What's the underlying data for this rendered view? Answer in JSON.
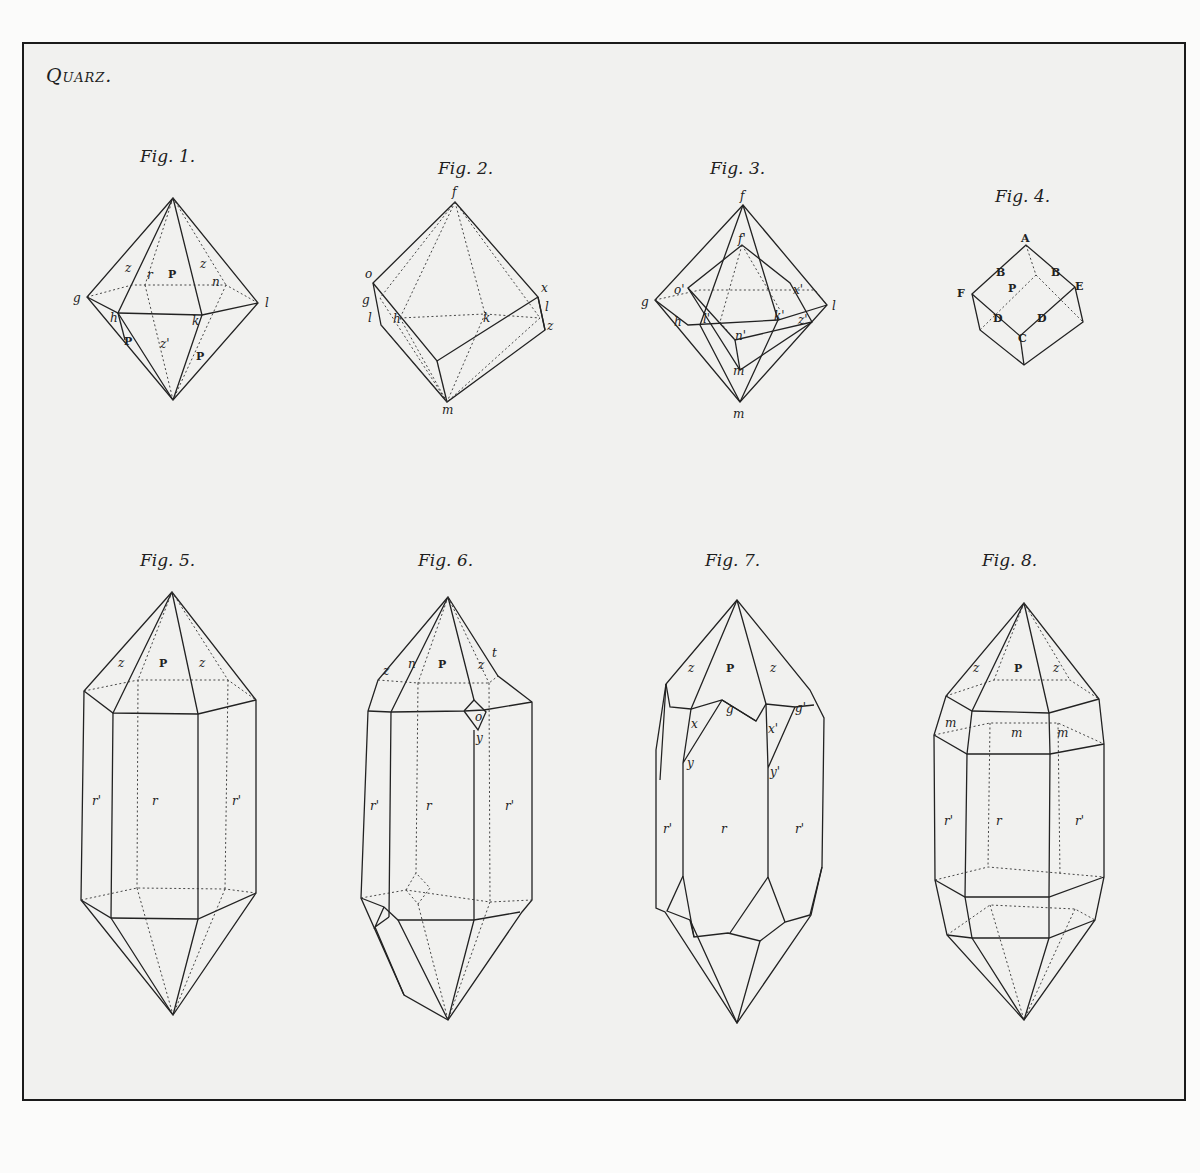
{
  "plate": {
    "title": "Quarz."
  },
  "figures": [
    {
      "id": "fig1",
      "caption": "Fig. 1.",
      "labels": [
        "z",
        "r",
        "P",
        "z",
        "n",
        "g",
        "l",
        "h",
        "k",
        "P",
        "z'",
        "P"
      ]
    },
    {
      "id": "fig2",
      "caption": "Fig. 2.",
      "labels": [
        "f",
        "o",
        "x",
        "g",
        "l",
        "h",
        "k",
        "l",
        "z",
        "m"
      ]
    },
    {
      "id": "fig3",
      "caption": "Fig. 3.",
      "labels": [
        "f",
        "f'",
        "o'",
        "x'",
        "g",
        "l",
        "h",
        "l'",
        "k'",
        "z'",
        "n'",
        "m",
        "m"
      ]
    },
    {
      "id": "fig4",
      "caption": "Fig. 4.",
      "labels": [
        "A",
        "B",
        "B",
        "F",
        "P",
        "E",
        "D",
        "D",
        "C"
      ]
    },
    {
      "id": "fig5",
      "caption": "Fig. 5.",
      "labels": [
        "z",
        "P",
        "z",
        "r'",
        "r",
        "r'"
      ]
    },
    {
      "id": "fig6",
      "caption": "Fig. 6.",
      "labels": [
        "z",
        "n",
        "P",
        "z",
        "t",
        "o",
        "y",
        "r'",
        "r",
        "r'"
      ]
    },
    {
      "id": "fig7",
      "caption": "Fig. 7.",
      "labels": [
        "z",
        "P",
        "z",
        "g",
        "g'",
        "x",
        "x'",
        "y",
        "y'",
        "r'",
        "r",
        "r'"
      ]
    },
    {
      "id": "fig8",
      "caption": "Fig. 8.",
      "labels": [
        "z",
        "P",
        "z",
        "m",
        "m",
        "m",
        "r'",
        "r",
        "r'"
      ]
    }
  ]
}
